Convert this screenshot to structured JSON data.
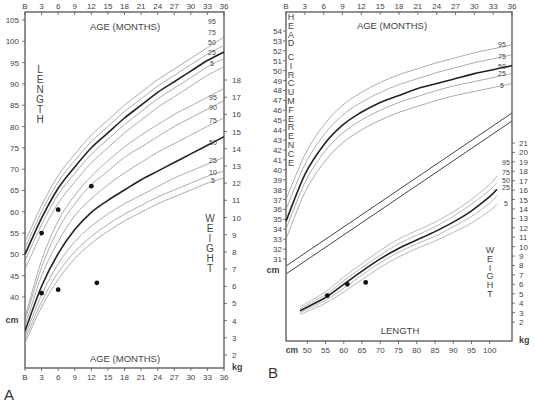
{
  "figure": {
    "panel_a_label": "A",
    "panel_b_label": "B"
  },
  "chart_data": [
    {
      "panel": "A",
      "type": "line",
      "title": "Length and weight for age, birth to 36 months",
      "top_axis": {
        "label": "AGE (MONTHS)",
        "ticks": [
          "B",
          "3",
          "6",
          "9",
          "12",
          "15",
          "18",
          "21",
          "24",
          "27",
          "30",
          "33",
          "36"
        ]
      },
      "bottom_axis": {
        "label": "AGE (MONTHS)",
        "ticks": [
          "B",
          "3",
          "6",
          "9",
          "12",
          "15",
          "18",
          "21",
          "24",
          "27",
          "30",
          "33",
          "36"
        ]
      },
      "left_axis": {
        "label": "LENGTH",
        "unit": "cm",
        "ticks": [
          40,
          45,
          50,
          55,
          60,
          65,
          70,
          75,
          80,
          85,
          90,
          95,
          100,
          105
        ],
        "ylim": [
          40,
          105
        ]
      },
      "right_axis": {
        "label": "WEIGHT",
        "unit": "kg",
        "ticks": [
          2,
          3,
          4,
          5,
          6,
          7,
          8,
          9,
          10,
          11,
          12,
          13,
          14,
          15,
          16,
          17,
          18
        ],
        "ylim": [
          1.5,
          18
        ]
      },
      "length_percentiles": {
        "labels": [
          "95",
          "75",
          "50",
          "25",
          "5"
        ],
        "x_months": [
          0,
          3,
          6,
          9,
          12,
          15,
          18,
          21,
          24,
          27,
          30,
          33,
          36
        ],
        "series": [
          {
            "name": "95",
            "values": [
              53,
              61.5,
              68.5,
              73.5,
              78,
              81.5,
              85,
              88,
              91,
              93.5,
              96,
              98.5,
              101
            ]
          },
          {
            "name": "75",
            "values": [
              51.5,
              60,
              67,
              72,
              76.5,
              80,
              83.5,
              86.5,
              89.5,
              92,
              94.5,
              97,
              99
            ]
          },
          {
            "name": "50",
            "values": [
              50,
              58.5,
              65.5,
              70.5,
              75,
              78.5,
              82,
              85,
              88,
              90.5,
              93,
              95.5,
              97.5
            ]
          },
          {
            "name": "25",
            "values": [
              48.5,
              57,
              64,
              69,
              73.5,
              77,
              80.5,
              83.5,
              86.5,
              89,
              91.5,
              94,
              96
            ]
          },
          {
            "name": "5",
            "values": [
              46.5,
              55,
              62,
              67,
              71.5,
              75,
              78.5,
              81.5,
              84.5,
              87,
              89.5,
              92,
              94
            ]
          }
        ]
      },
      "weight_percentiles": {
        "labels": [
          "95",
          "90",
          "75",
          "50",
          "25",
          "10",
          "5"
        ],
        "x_months": [
          0,
          3,
          6,
          9,
          12,
          15,
          18,
          21,
          24,
          27,
          30,
          33,
          36
        ],
        "series": [
          {
            "name": "95",
            "values": [
              4.2,
              7.5,
              9.8,
              11.3,
              12.4,
              13.3,
              14.1,
              14.8,
              15.4,
              16,
              16.5,
              17,
              17.5
            ]
          },
          {
            "name": "90",
            "values": [
              4,
              7.1,
              9.3,
              10.8,
              11.9,
              12.7,
              13.5,
              14.1,
              14.7,
              15.3,
              15.8,
              16.3,
              16.8
            ]
          },
          {
            "name": "75",
            "values": [
              3.7,
              6.6,
              8.6,
              10.1,
              11.1,
              11.9,
              12.6,
              13.2,
              13.8,
              14.3,
              14.8,
              15.3,
              15.8
            ]
          },
          {
            "name": "50",
            "values": [
              3.4,
              6.0,
              7.9,
              9.3,
              10.3,
              11.0,
              11.6,
              12.2,
              12.7,
              13.2,
              13.7,
              14.2,
              14.7
            ]
          },
          {
            "name": "25",
            "values": [
              3.1,
              5.5,
              7.3,
              8.6,
              9.5,
              10.2,
              10.8,
              11.3,
              11.8,
              12.3,
              12.7,
              13.1,
              13.5
            ]
          },
          {
            "name": "10",
            "values": [
              2.9,
              5.1,
              6.8,
              8.0,
              8.9,
              9.6,
              10.2,
              10.7,
              11.2,
              11.6,
              12.0,
              12.4,
              12.7
            ]
          },
          {
            "name": "5",
            "values": [
              2.7,
              4.8,
              6.4,
              7.6,
              8.5,
              9.2,
              9.8,
              10.3,
              10.8,
              11.2,
              11.6,
              12.0,
              12.3
            ]
          }
        ]
      },
      "patient_length_points": [
        {
          "age_months": 3,
          "length_cm": 55
        },
        {
          "age_months": 6,
          "length_cm": 60.5
        },
        {
          "age_months": 12,
          "length_cm": 66
        }
      ],
      "patient_weight_points": [
        {
          "age_months": 3,
          "weight_kg": 5.6
        },
        {
          "age_months": 6,
          "weight_kg": 5.8
        },
        {
          "age_months": 13,
          "weight_kg": 6.2
        }
      ]
    },
    {
      "panel": "B",
      "type": "line",
      "title": "Head circumference for age and weight for length",
      "top_axis": {
        "label": "AGE (MONTHS)",
        "ticks": [
          "B",
          "3",
          "6",
          "9",
          "12",
          "15",
          "18",
          "21",
          "24",
          "27",
          "30",
          "33",
          "36"
        ]
      },
      "bottom_axis": {
        "label": "LENGTH",
        "unit": "cm",
        "ticks": [
          "50",
          "55",
          "60",
          "65",
          "70",
          "75",
          "80",
          "85",
          "90",
          "95",
          "100"
        ]
      },
      "left_axis": {
        "label": "HEAD CIRCUMFERENCE",
        "unit": "cm",
        "ticks": [
          31,
          32,
          33,
          34,
          35,
          36,
          37,
          38,
          39,
          40,
          41,
          42,
          43,
          44,
          45,
          46,
          47,
          48,
          49,
          50,
          51,
          52,
          53,
          54
        ],
        "ylim": [
          30,
          55
        ]
      },
      "right_axis": {
        "label": "WEIGHT",
        "unit": "kg",
        "ticks": [
          2,
          3,
          4,
          5,
          6,
          7,
          8,
          9,
          10,
          11,
          12,
          13,
          14,
          15,
          16,
          17,
          18,
          19,
          20,
          21
        ],
        "ylim": [
          1,
          22
        ]
      },
      "head_circ_percentiles": {
        "labels": [
          "95",
          "75",
          "50",
          "25",
          "5"
        ],
        "x_months": [
          0,
          3,
          6,
          9,
          12,
          15,
          18,
          21,
          24,
          27,
          30,
          33,
          36
        ],
        "series": [
          {
            "name": "95",
            "values": [
              37,
              41.5,
              44.5,
              46.5,
              47.8,
              48.8,
              49.6,
              50.2,
              50.8,
              51.3,
              51.8,
              52.2,
              52.6
            ]
          },
          {
            "name": "75",
            "values": [
              36,
              40.5,
              43.5,
              45.5,
              46.8,
              47.8,
              48.6,
              49.2,
              49.8,
              50.3,
              50.8,
              51.2,
              51.6
            ]
          },
          {
            "name": "50",
            "values": [
              34.8,
              39.5,
              42.5,
              44.5,
              45.8,
              46.8,
              47.5,
              48.2,
              48.7,
              49.2,
              49.7,
              50.1,
              50.5
            ]
          },
          {
            "name": "25",
            "values": [
              34,
              38.7,
              41.7,
              43.7,
              45,
              46,
              46.8,
              47.4,
              48,
              48.5,
              48.9,
              49.3,
              49.7
            ]
          },
          {
            "name": "5",
            "values": [
              33,
              37.7,
              40.7,
              42.7,
              44,
              45,
              45.8,
              46.4,
              47,
              47.5,
              47.9,
              48.3,
              48.7
            ]
          }
        ]
      },
      "weight_for_length_percentiles": {
        "labels": [
          "95",
          "75",
          "50",
          "25",
          "5"
        ],
        "x_length_cm": [
          48,
          55,
          60,
          65,
          70,
          75,
          80,
          85,
          90,
          95,
          100,
          102
        ],
        "series": [
          {
            "name": "95",
            "values": [
              3.6,
              5.2,
              6.8,
              8.2,
              9.6,
              10.8,
              11.7,
              12.6,
              13.7,
              15,
              16.6,
              17.5
            ]
          },
          {
            "name": "75",
            "values": [
              3.4,
              4.9,
              6.4,
              7.8,
              9.1,
              10.3,
              11.2,
              12.1,
              13.2,
              14.5,
              16,
              16.8
            ]
          },
          {
            "name": "50",
            "values": [
              3.2,
              4.6,
              6.0,
              7.4,
              8.7,
              9.8,
              10.7,
              11.6,
              12.6,
              13.8,
              15.3,
              16.1
            ]
          },
          {
            "name": "25",
            "values": [
              3.0,
              4.3,
              5.6,
              7.0,
              8.3,
              9.4,
              10.3,
              11.1,
              12.1,
              13.2,
              14.6,
              15.4
            ]
          },
          {
            "name": "5",
            "values": [
              2.8,
              4.0,
              5.2,
              6.5,
              7.8,
              8.9,
              9.8,
              10.6,
              11.5,
              12.5,
              13.8,
              14.5
            ]
          }
        ]
      },
      "patient_weight_for_length_points": [
        {
          "length_cm": 55.5,
          "weight_kg": 4.8
        },
        {
          "length_cm": 61,
          "weight_kg": 6.0
        },
        {
          "length_cm": 66,
          "weight_kg": 6.2
        }
      ]
    }
  ]
}
